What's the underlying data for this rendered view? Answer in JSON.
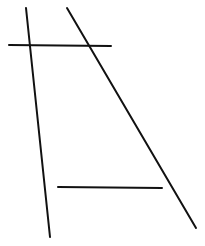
{
  "diagram": {
    "width": 205,
    "height": 246,
    "background": "#ffffff",
    "stroke_color": "#111111",
    "stroke_width": 2,
    "lines": [
      {
        "id": "left-slanted-line",
        "x1": 26,
        "y1": 8,
        "x2": 50,
        "y2": 237
      },
      {
        "id": "right-slanted-line",
        "x1": 67,
        "y1": 8,
        "x2": 196,
        "y2": 228
      },
      {
        "id": "upper-horizontal-line",
        "x1": 9,
        "y1": 45,
        "x2": 111,
        "y2": 46
      },
      {
        "id": "lower-horizontal-line",
        "x1": 58,
        "y1": 187,
        "x2": 162,
        "y2": 188
      }
    ]
  }
}
